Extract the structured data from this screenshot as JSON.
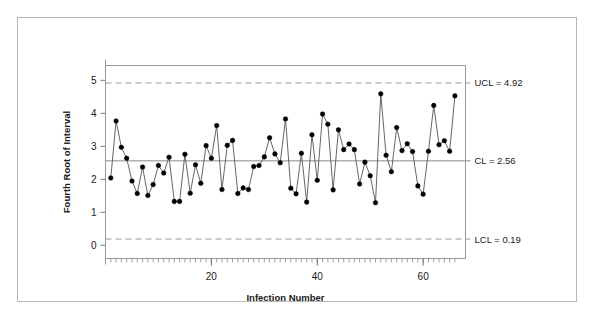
{
  "figure": {
    "background_color": "#ffffff",
    "border_color": "#b8b8b8"
  },
  "chart_data": {
    "type": "line",
    "title": "",
    "subtitle": "",
    "xlabel": "Infection Number",
    "ylabel": "Fourth Root of Interval",
    "xlim": [
      0,
      68
    ],
    "ylim": [
      -0.4,
      5.45
    ],
    "xticks": [
      20,
      40,
      60
    ],
    "xtick_labels": [
      "20",
      "40",
      "60"
    ],
    "yticks": [
      0,
      1,
      2,
      3,
      4,
      5
    ],
    "ytick_labels": [
      "0",
      "1",
      "2",
      "3",
      "4",
      "5"
    ],
    "grid": false,
    "legend": "none",
    "marker": "filled-circle",
    "marker_color": "#000000",
    "line_color": "#555555",
    "control_limits": {
      "ucl": {
        "value": 4.92,
        "label": "UCL = 4.92",
        "style": "dashed",
        "color": "#999999"
      },
      "cl": {
        "value": 2.56,
        "label": "CL = 2.56",
        "style": "solid",
        "color": "#888888"
      },
      "lcl": {
        "value": 0.19,
        "label": "LCL = 0.19",
        "style": "dashed",
        "color": "#999999"
      }
    },
    "x": [
      1,
      2,
      3,
      4,
      5,
      6,
      7,
      8,
      9,
      10,
      11,
      12,
      13,
      14,
      15,
      16,
      17,
      18,
      19,
      20,
      21,
      22,
      23,
      24,
      25,
      26,
      27,
      28,
      29,
      30,
      31,
      32,
      33,
      34,
      35,
      36,
      37,
      38,
      39,
      40,
      41,
      42,
      43,
      44,
      45,
      46,
      47,
      48,
      49,
      50,
      51,
      52,
      53,
      54,
      55,
      56,
      57,
      58,
      59,
      60,
      61,
      62,
      63,
      64,
      65,
      66
    ],
    "values": [
      2.04,
      3.77,
      2.97,
      2.64,
      1.95,
      1.57,
      2.37,
      1.51,
      1.84,
      2.42,
      2.19,
      2.67,
      1.33,
      1.33,
      2.76,
      1.58,
      2.44,
      1.88,
      3.02,
      2.64,
      3.63,
      1.69,
      3.03,
      3.18,
      1.57,
      1.74,
      1.69,
      2.39,
      2.42,
      2.68,
      3.26,
      2.77,
      2.5,
      3.83,
      1.73,
      1.56,
      2.79,
      1.31,
      3.35,
      1.97,
      3.98,
      3.67,
      1.68,
      3.5,
      2.9,
      3.07,
      2.9,
      1.86,
      2.52,
      2.11,
      1.29,
      4.59,
      2.73,
      2.23,
      3.57,
      2.87,
      3.08,
      2.84,
      1.8,
      1.55,
      2.85,
      4.24,
      3.05,
      3.17,
      2.85,
      4.53
    ]
  },
  "axes": {
    "y_axis_title": "Fourth Root of Interval",
    "x_axis_title": "Infection Number"
  },
  "annotations": {
    "ucl_label": "UCL = 4.92",
    "cl_label": "CL = 2.56",
    "lcl_label": "LCL = 0.19"
  }
}
